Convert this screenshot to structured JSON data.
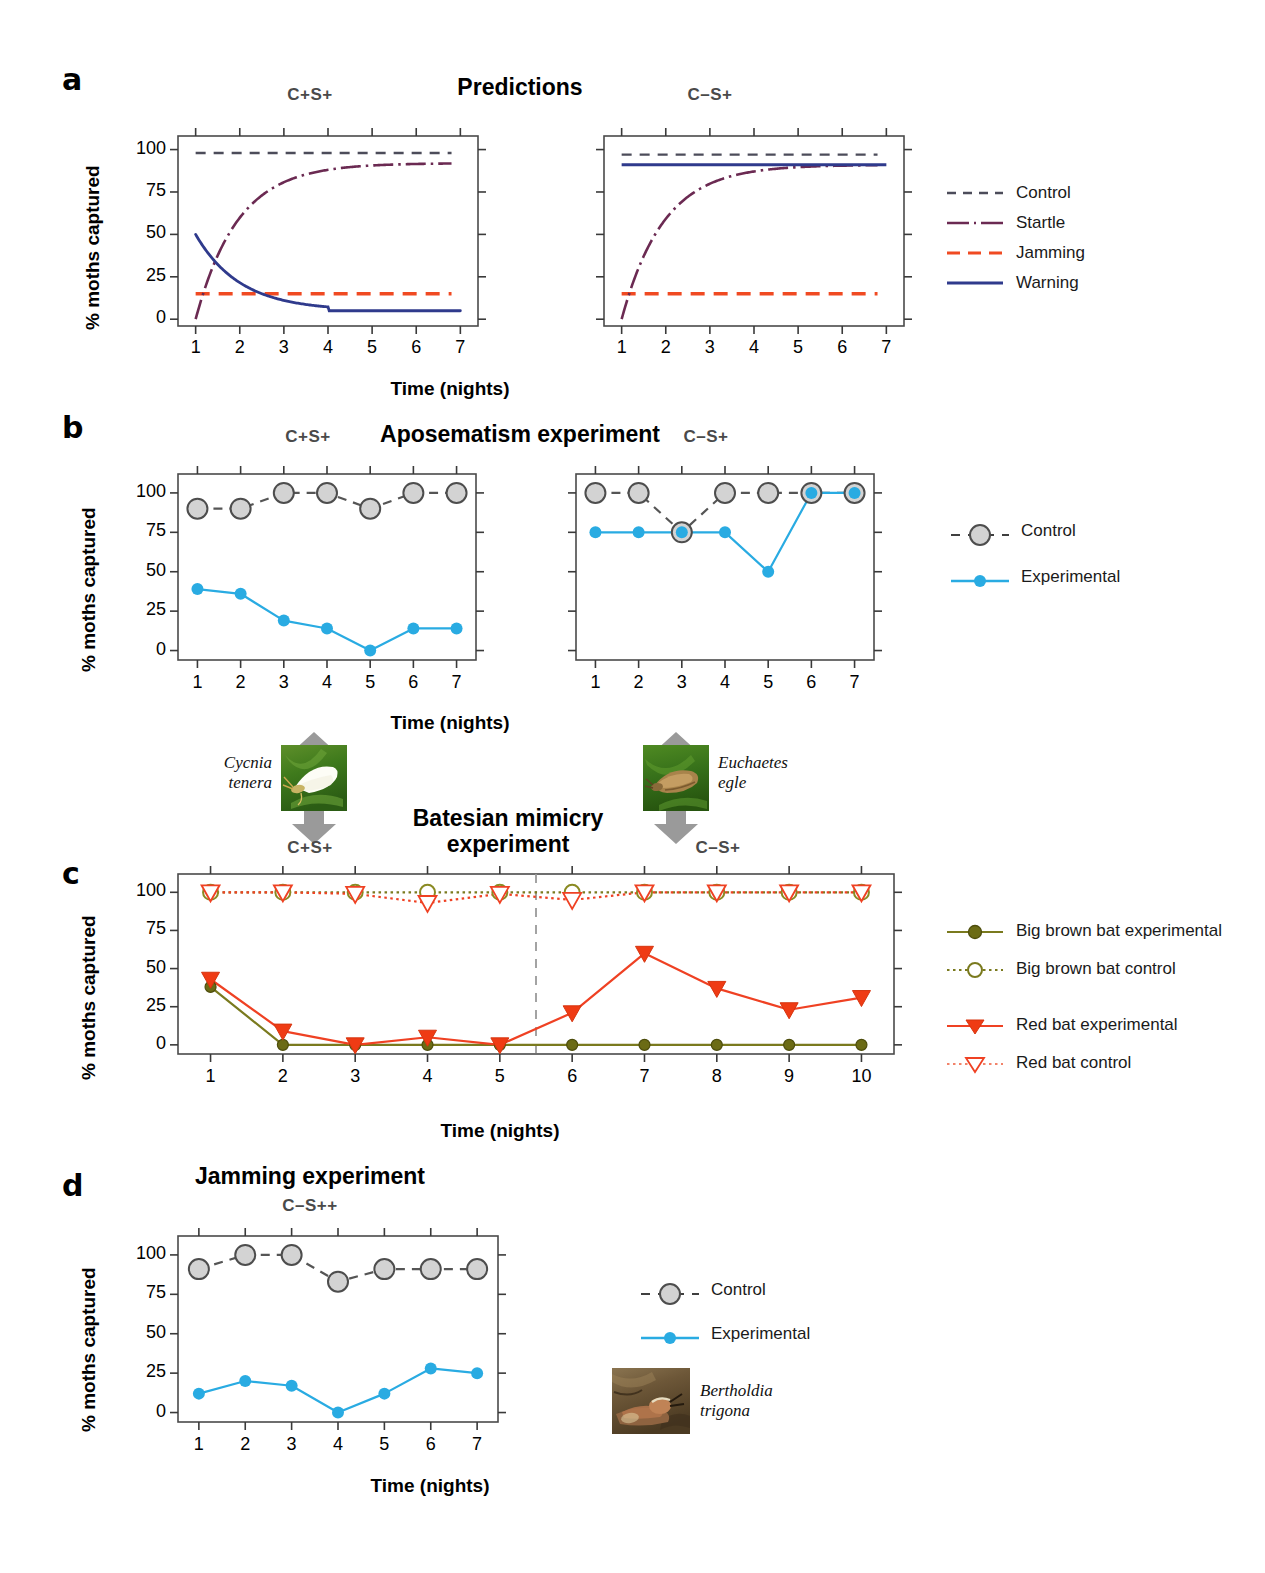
{
  "figure": {
    "panels": [
      "a",
      "b",
      "c",
      "d"
    ],
    "axis_y_title": "% moths captured",
    "axis_x_title": "Time (nights)",
    "y_ticks": [
      "0",
      "25",
      "50",
      "75",
      "100"
    ]
  },
  "panel_a": {
    "letter": "a",
    "title": "Predictions",
    "left_condition": "C+S+",
    "right_condition": "C–S+",
    "legend": [
      {
        "label": "Control",
        "color": "#4c4c5a",
        "style": "dashed"
      },
      {
        "label": "Startle",
        "color": "#6b2a52",
        "style": "dashdot"
      },
      {
        "label": "Jamming",
        "color": "#f04a22",
        "style": "longdash"
      },
      {
        "label": "Warning",
        "color": "#2f3a8c",
        "style": "solid"
      }
    ]
  },
  "panel_b": {
    "letter": "b",
    "title": "Aposematism experiment",
    "left_condition": "C+S+",
    "right_condition": "C–S+",
    "legend": [
      {
        "label": "Control",
        "color": "#555555",
        "marker": "big-gray-circle"
      },
      {
        "label": "Experimental",
        "color": "#29abe2",
        "marker": "small-blue-circle"
      }
    ],
    "left_species": "Cycnia\ntenera",
    "left_species_line1": "Cycnia",
    "left_species_line2": "tenera",
    "right_species_line1": "Euchaetes",
    "right_species_line2": "egle"
  },
  "panel_c": {
    "letter": "c",
    "title_line1": "Batesian mimicry",
    "title_line2": "experiment",
    "left_condition": "C+S+",
    "right_condition": "C–S+",
    "legend": [
      {
        "label": "Big brown bat experimental",
        "color": "#7a7a1e",
        "marker": "filled-circle",
        "style": "solid"
      },
      {
        "label": "Big brown bat control",
        "color": "#7a7a1e",
        "marker": "open-circle",
        "style": "dotted"
      },
      {
        "label": "Red bat experimental",
        "color": "#ef4123",
        "marker": "filled-triangle-down",
        "style": "solid"
      },
      {
        "label": "Red bat control",
        "color": "#ef4123",
        "marker": "open-triangle-down",
        "style": "dotted"
      }
    ]
  },
  "panel_d": {
    "letter": "d",
    "title": "Jamming experiment",
    "condition": "C–S++",
    "legend": [
      {
        "label": "Control",
        "color": "#555555",
        "marker": "big-gray-circle"
      },
      {
        "label": "Experimental",
        "color": "#29abe2",
        "marker": "small-blue-circle"
      }
    ],
    "species_line1": "Bertholdia",
    "species_line2": "trigona"
  },
  "chart_data": [
    {
      "id": "a-left",
      "type": "line",
      "title": "Predictions — C+S+",
      "xlabel": "Time (nights)",
      "ylabel": "% moths captured",
      "xlim": [
        0.6,
        7.4
      ],
      "ylim": [
        -4,
        108
      ],
      "x": [
        1,
        2,
        3,
        4,
        5,
        6,
        7
      ],
      "grid": false,
      "series": [
        {
          "name": "Control",
          "values": [
            98,
            98,
            98,
            98,
            98,
            98,
            98
          ],
          "color": "#4c4c5a",
          "style": "dashed"
        },
        {
          "name": "Startle",
          "values": [
            0,
            50,
            80,
            90,
            92,
            92,
            92
          ],
          "color": "#6b2a52",
          "style": "dashdot"
        },
        {
          "name": "Jamming",
          "values": [
            15,
            15,
            15,
            15,
            15,
            15,
            15
          ],
          "color": "#f04a22",
          "style": "longdash"
        },
        {
          "name": "Warning",
          "values": [
            50,
            25,
            12,
            6,
            5,
            5,
            5
          ],
          "color": "#2f3a8c",
          "style": "solid"
        }
      ]
    },
    {
      "id": "a-right",
      "type": "line",
      "title": "Predictions — C–S+",
      "xlabel": "Time (nights)",
      "ylabel": "% moths captured",
      "xlim": [
        0.6,
        7.4
      ],
      "ylim": [
        -4,
        108
      ],
      "x": [
        1,
        2,
        3,
        4,
        5,
        6,
        7
      ],
      "grid": false,
      "series": [
        {
          "name": "Control",
          "values": [
            97,
            97,
            97,
            97,
            97,
            97,
            97
          ],
          "color": "#4c4c5a",
          "style": "dashed"
        },
        {
          "name": "Startle",
          "values": [
            0,
            55,
            82,
            90,
            91,
            91,
            91
          ],
          "color": "#6b2a52",
          "style": "dashdot"
        },
        {
          "name": "Jamming",
          "values": [
            15,
            15,
            15,
            15,
            15,
            15,
            14
          ],
          "color": "#f04a22",
          "style": "longdash"
        },
        {
          "name": "Warning",
          "values": [
            91,
            91,
            91,
            91,
            91,
            91,
            91
          ],
          "color": "#2f3a8c",
          "style": "solid"
        }
      ]
    },
    {
      "id": "b-left",
      "type": "line",
      "title": "Aposematism experiment — C+S+",
      "xlabel": "Time (nights)",
      "ylabel": "% moths captured",
      "xlim": [
        0.55,
        7.45
      ],
      "ylim": [
        -6,
        112
      ],
      "x": [
        1,
        2,
        3,
        4,
        5,
        6,
        7
      ],
      "grid": false,
      "series": [
        {
          "name": "Control",
          "values": [
            90,
            90,
            100,
            100,
            90,
            100,
            100
          ],
          "color": "#555555",
          "style": "dashed",
          "marker": "big-gray-circle"
        },
        {
          "name": "Experimental",
          "values": [
            39,
            36,
            19,
            14,
            0,
            14,
            14
          ],
          "color": "#29abe2",
          "style": "solid",
          "marker": "small-blue-circle"
        }
      ]
    },
    {
      "id": "b-right",
      "type": "line",
      "title": "Aposematism experiment — C–S+",
      "xlabel": "Time (nights)",
      "ylabel": "% moths captured",
      "xlim": [
        0.55,
        7.45
      ],
      "ylim": [
        -6,
        112
      ],
      "x": [
        1,
        2,
        3,
        4,
        5,
        6,
        7
      ],
      "grid": false,
      "series": [
        {
          "name": "Control",
          "values": [
            100,
            100,
            75,
            100,
            100,
            100,
            100
          ],
          "color": "#555555",
          "style": "dashed",
          "marker": "big-gray-circle"
        },
        {
          "name": "Experimental",
          "values": [
            75,
            75,
            75,
            75,
            50,
            100,
            100
          ],
          "color": "#29abe2",
          "style": "solid",
          "marker": "small-blue-circle"
        }
      ]
    },
    {
      "id": "c",
      "type": "line",
      "title": "Batesian mimicry experiment",
      "xlabel": "Time (nights)",
      "ylabel": "% moths captured",
      "xlim": [
        0.55,
        10.45
      ],
      "ylim": [
        -6,
        112
      ],
      "x": [
        1,
        2,
        3,
        4,
        5,
        6,
        7,
        8,
        9,
        10
      ],
      "grid": false,
      "divider_x": 5.5,
      "series": [
        {
          "name": "Big brown bat experimental",
          "values": [
            38,
            0,
            0,
            0,
            0,
            0,
            0,
            0,
            0,
            0
          ],
          "color": "#7a7a1e",
          "style": "solid",
          "marker": "filled-circle"
        },
        {
          "name": "Big brown bat control",
          "values": [
            100,
            100,
            100,
            100,
            100,
            100,
            100,
            100,
            100,
            100
          ],
          "color": "#7a7a1e",
          "style": "dotted",
          "marker": "open-circle"
        },
        {
          "name": "Red bat experimental",
          "values": [
            43,
            9,
            0,
            5,
            0,
            21,
            60,
            37,
            23,
            31
          ],
          "color": "#ef4123",
          "style": "solid",
          "marker": "filled-triangle-down"
        },
        {
          "name": "Red bat control",
          "values": [
            100,
            100,
            99,
            93,
            99,
            95,
            100,
            100,
            100,
            100
          ],
          "color": "#ef4123",
          "style": "dotted",
          "marker": "open-triangle-down"
        }
      ]
    },
    {
      "id": "d",
      "type": "line",
      "title": "Jamming experiment — C–S++",
      "xlabel": "Time (nights)",
      "ylabel": "% moths captured",
      "xlim": [
        0.55,
        7.45
      ],
      "ylim": [
        -6,
        112
      ],
      "x": [
        1,
        2,
        3,
        4,
        5,
        6,
        7
      ],
      "grid": false,
      "series": [
        {
          "name": "Control",
          "values": [
            91,
            100,
            100,
            83,
            91,
            91,
            91
          ],
          "color": "#555555",
          "style": "dashed",
          "marker": "big-gray-circle"
        },
        {
          "name": "Experimental",
          "values": [
            12,
            20,
            17,
            0,
            12,
            28,
            25
          ],
          "color": "#29abe2",
          "style": "solid",
          "marker": "small-blue-circle"
        }
      ]
    }
  ]
}
